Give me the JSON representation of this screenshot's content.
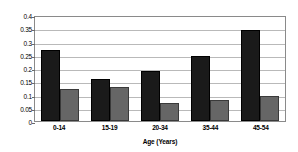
{
  "chart_data": {
    "type": "bar",
    "title": "",
    "xlabel": "Age (Years)",
    "ylabel": "",
    "categories": [
      "0-14",
      "15-19",
      "20-34",
      "35-44",
      "45-54"
    ],
    "series": [
      {
        "name": "series-1",
        "color": "#1a1a1a",
        "values": [
          0.268,
          0.158,
          0.188,
          0.245,
          0.345
        ]
      },
      {
        "name": "series-2",
        "color": "#666666",
        "values": [
          0.12,
          0.128,
          0.068,
          0.078,
          0.096
        ]
      }
    ],
    "ylim": [
      0,
      0.4
    ],
    "yticks": [
      "0",
      "0.05",
      "0.1",
      "0.15",
      "0.2",
      "0.25",
      "0.3",
      "0.35",
      "0.4"
    ],
    "ytick_values": [
      0,
      0.05,
      0.1,
      0.15,
      0.2,
      0.25,
      0.3,
      0.35,
      0.4
    ],
    "grid": true,
    "legend": "none",
    "plot_border_color": "#8a8a8a",
    "gridline_color": "#b9b9b9",
    "background": "#ffffff"
  }
}
